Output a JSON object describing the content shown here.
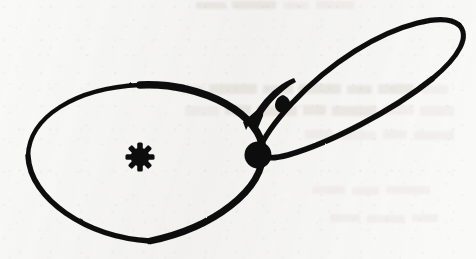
{
  "figure": {
    "kind": "orbital-diagram",
    "caption": "",
    "background_color": "#f9f9f8",
    "ink_color": "#0d0d0d",
    "ghost_text_color": "#a18c75",
    "width": 476,
    "height": 259
  },
  "elements": {
    "sun": {
      "name": "sun-symbol",
      "label": "",
      "center_x": 140,
      "center_y": 157,
      "size": 29,
      "ray_count": 8,
      "color": "#0d0d0d"
    },
    "node": {
      "name": "orbital-node-dot",
      "label": "",
      "center_x": 258,
      "center_y": 155,
      "radius": 13,
      "color": "#0d0d0d"
    },
    "body_marker": {
      "name": "orbiting-body-marker",
      "label": "",
      "center_x": 283,
      "center_y": 103,
      "radius": 6,
      "color": "#0d0d0d"
    },
    "inner_orbit": {
      "name": "inner-orbit-ellipse",
      "label": "",
      "center_x": 148,
      "center_y": 163,
      "radius_x": 121,
      "radius_y": 79,
      "rotation_deg": -4,
      "stroke_width": 6,
      "color": "#0d0d0d"
    },
    "outer_orbit": {
      "name": "outer-orbit-ellipse",
      "label": "",
      "center_x": 362,
      "center_y": 89,
      "radius_x": 124,
      "radius_y": 39,
      "rotation_deg": -36,
      "stroke_width": 5,
      "color": "#0d0d0d"
    },
    "direction_arrow": {
      "name": "direction-of-motion-arrow",
      "label": "",
      "tip_x": 247,
      "tip_y": 118,
      "tail_x": 293,
      "tail_y": 79,
      "color": "#0d0d0d"
    }
  },
  "ghost_text_blocks": [
    {
      "x": 196,
      "y": 2,
      "w": 30,
      "h": 7,
      "pale": false
    },
    {
      "x": 232,
      "y": 1,
      "w": 44,
      "h": 8,
      "pale": false
    },
    {
      "x": 283,
      "y": 2,
      "w": 26,
      "h": 7,
      "pale": true
    },
    {
      "x": 316,
      "y": 1,
      "w": 38,
      "h": 8,
      "pale": true
    },
    {
      "x": 181,
      "y": 85,
      "w": 22,
      "h": 9,
      "pale": true
    },
    {
      "x": 209,
      "y": 84,
      "w": 48,
      "h": 10,
      "pale": false
    },
    {
      "x": 263,
      "y": 85,
      "w": 30,
      "h": 9,
      "pale": false
    },
    {
      "x": 299,
      "y": 84,
      "w": 42,
      "h": 10,
      "pale": false
    },
    {
      "x": 347,
      "y": 85,
      "w": 25,
      "h": 9,
      "pale": false
    },
    {
      "x": 378,
      "y": 84,
      "w": 36,
      "h": 10,
      "pale": false
    },
    {
      "x": 420,
      "y": 85,
      "w": 28,
      "h": 9,
      "pale": true
    },
    {
      "x": 185,
      "y": 106,
      "w": 34,
      "h": 10,
      "pale": true
    },
    {
      "x": 225,
      "y": 105,
      "w": 26,
      "h": 10,
      "pale": false
    },
    {
      "x": 257,
      "y": 106,
      "w": 40,
      "h": 10,
      "pale": false
    },
    {
      "x": 303,
      "y": 105,
      "w": 23,
      "h": 10,
      "pale": false
    },
    {
      "x": 332,
      "y": 106,
      "w": 45,
      "h": 10,
      "pale": false
    },
    {
      "x": 383,
      "y": 105,
      "w": 31,
      "h": 10,
      "pale": true
    },
    {
      "x": 420,
      "y": 106,
      "w": 34,
      "h": 10,
      "pale": true
    },
    {
      "x": 305,
      "y": 130,
      "w": 28,
      "h": 9,
      "pale": true
    },
    {
      "x": 340,
      "y": 131,
      "w": 36,
      "h": 9,
      "pale": true
    },
    {
      "x": 383,
      "y": 130,
      "w": 24,
      "h": 9,
      "pale": true
    },
    {
      "x": 414,
      "y": 131,
      "w": 40,
      "h": 9,
      "pale": true
    },
    {
      "x": 312,
      "y": 186,
      "w": 33,
      "h": 8,
      "pale": true
    },
    {
      "x": 352,
      "y": 187,
      "w": 27,
      "h": 8,
      "pale": true
    },
    {
      "x": 386,
      "y": 186,
      "w": 44,
      "h": 8,
      "pale": true
    },
    {
      "x": 330,
      "y": 214,
      "w": 30,
      "h": 8,
      "pale": true
    },
    {
      "x": 367,
      "y": 215,
      "w": 38,
      "h": 8,
      "pale": true
    },
    {
      "x": 412,
      "y": 214,
      "w": 26,
      "h": 8,
      "pale": true
    }
  ]
}
